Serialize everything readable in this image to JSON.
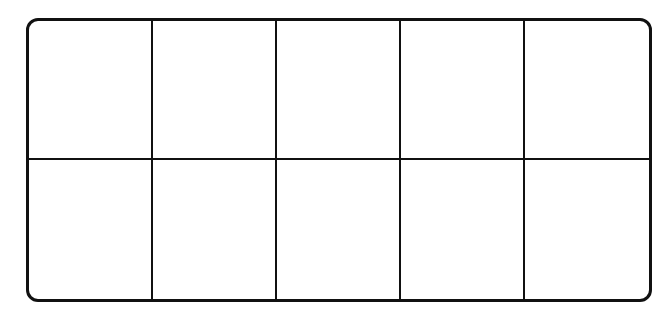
{
  "diagram": {
    "type": "ten-frame",
    "rows": 2,
    "columns": 5,
    "cells": [
      {
        "row": 0,
        "col": 0,
        "filled": false
      },
      {
        "row": 0,
        "col": 1,
        "filled": false
      },
      {
        "row": 0,
        "col": 2,
        "filled": false
      },
      {
        "row": 0,
        "col": 3,
        "filled": false
      },
      {
        "row": 0,
        "col": 4,
        "filled": false
      },
      {
        "row": 1,
        "col": 0,
        "filled": false
      },
      {
        "row": 1,
        "col": 1,
        "filled": false
      },
      {
        "row": 1,
        "col": 2,
        "filled": false
      },
      {
        "row": 1,
        "col": 3,
        "filled": false
      },
      {
        "row": 1,
        "col": 4,
        "filled": false
      }
    ],
    "colors": {
      "line": "#111111",
      "background": "#ffffff"
    }
  }
}
